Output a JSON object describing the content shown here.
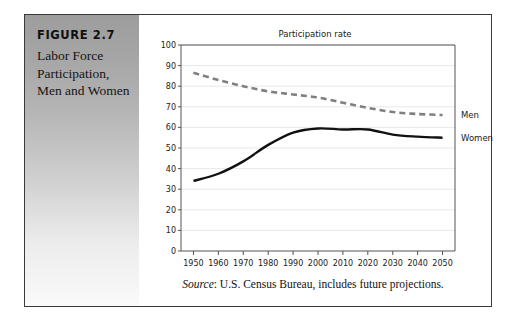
{
  "figure": {
    "number": "FIGURE 2.7",
    "caption": "Labor Force Participation, Men and Women"
  },
  "source": {
    "label": "Source",
    "text": ": U.S. Census Bureau, includes future projections."
  },
  "colors": {
    "panel_top": "#9d9d9d",
    "panel_bottom": "#fafafa",
    "men_line": "#808080",
    "women_line": "#111111",
    "grid": "#e8e8e8",
    "axis": "#555555",
    "border": "#3a3a3a"
  },
  "chart_data": {
    "type": "line",
    "title": "Participation rate",
    "xlabel": "",
    "ylabel": "",
    "xlim": [
      1945,
      2055
    ],
    "ylim": [
      0,
      100
    ],
    "yticks": [
      0,
      10,
      20,
      30,
      40,
      50,
      60,
      70,
      80,
      90,
      100
    ],
    "xticks": [
      1950,
      1960,
      1970,
      1980,
      1990,
      2000,
      2010,
      2020,
      2030,
      2040,
      2050
    ],
    "grid": "horizontal",
    "legend_position": "right-inline",
    "x": [
      1950,
      1960,
      1970,
      1980,
      1990,
      2000,
      2010,
      2020,
      2030,
      2040,
      2050
    ],
    "series": [
      {
        "name": "Men",
        "style": "dashed",
        "color": "#808080",
        "values": [
          86.5,
          83.0,
          80.0,
          77.5,
          76.0,
          74.5,
          72.0,
          69.5,
          67.5,
          66.5,
          66.0
        ]
      },
      {
        "name": "Women",
        "style": "solid",
        "color": "#111111",
        "values": [
          34.0,
          37.5,
          43.5,
          51.5,
          57.5,
          59.5,
          59.0,
          59.0,
          56.5,
          55.5,
          55.0
        ]
      }
    ]
  }
}
